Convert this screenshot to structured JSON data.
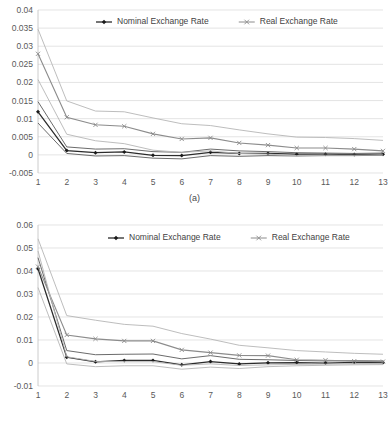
{
  "figure": {
    "panels": [
      {
        "id": "a",
        "caption": "(a)",
        "legend": [
          {
            "label": "Nominal Exchange Rate",
            "marker": "diamond-marker-icon",
            "color": "#2b2b2b"
          },
          {
            "label": "Real Exchange Rate",
            "marker": "x-marker-icon",
            "color": "#8c8c8c"
          }
        ]
      },
      {
        "id": "b",
        "caption": "(b)",
        "legend": [
          {
            "label": "Nominal Exchange Rate",
            "marker": "diamond-marker-icon",
            "color": "#2b2b2b"
          },
          {
            "label": "Real Exchange Rate",
            "marker": "x-marker-icon",
            "color": "#8c8c8c"
          }
        ]
      }
    ]
  },
  "chart_data": [
    {
      "type": "line",
      "title": "",
      "subtitle": "(a)",
      "xlabel": "",
      "ylabel": "",
      "x": [
        1,
        2,
        3,
        4,
        5,
        6,
        7,
        8,
        9,
        10,
        11,
        12,
        13
      ],
      "xtick_labels": [
        "1",
        "2",
        "3",
        "4",
        "5",
        "6",
        "7",
        "8",
        "9",
        "10",
        "11",
        "12",
        "13"
      ],
      "ytick_labels": [
        "-0.005",
        "0",
        "0.005",
        "0.01",
        "0.015",
        "0.02",
        "0.025",
        "0.03",
        "0.035",
        "0.04"
      ],
      "yticks": [
        -0.005,
        0,
        0.005,
        0.01,
        0.015,
        0.02,
        0.025,
        0.03,
        0.035,
        0.04
      ],
      "ylim": [
        -0.005,
        0.04
      ],
      "xlim": [
        1,
        13
      ],
      "grid": true,
      "legend_position": "top-center",
      "series": [
        {
          "name": "Nominal Exchange Rate",
          "role": "point-estimate",
          "marker": "diamond",
          "color": "#2b2b2b",
          "values": [
            0.0119,
            0.0012,
            0.0006,
            0.0008,
            -0.0001,
            -0.0002,
            0.0007,
            0.0004,
            0.0004,
            0.0002,
            0.0002,
            0.0001,
            0.0002
          ]
        },
        {
          "name": "Nominal Exchange Rate upper band",
          "role": "upper-confidence-band",
          "marker": "none",
          "color": "#5a5a5a",
          "values": [
            0.0147,
            0.0022,
            0.0016,
            0.0017,
            0.0009,
            0.0007,
            0.0016,
            0.0011,
            0.0009,
            0.0006,
            0.0005,
            0.0004,
            0.0005
          ]
        },
        {
          "name": "Nominal Exchange Rate lower band",
          "role": "lower-confidence-band",
          "marker": "none",
          "color": "#5a5a5a",
          "values": [
            0.0088,
            0.0004,
            -0.0003,
            -0.0002,
            -0.0009,
            -0.0011,
            -0.0002,
            -0.0004,
            -0.0002,
            -0.0003,
            -0.0002,
            -0.0002,
            -0.0001
          ]
        },
        {
          "name": "Real Exchange Rate",
          "role": "point-estimate",
          "marker": "x",
          "color": "#8c8c8c",
          "values": [
            0.0279,
            0.0104,
            0.0083,
            0.0079,
            0.0058,
            0.0044,
            0.0047,
            0.0033,
            0.0027,
            0.0019,
            0.0019,
            0.0016,
            0.0011
          ]
        },
        {
          "name": "Real Exchange Rate upper band",
          "role": "upper-confidence-band",
          "marker": "none",
          "color": "#b5b5b5",
          "values": [
            0.0347,
            0.0149,
            0.0121,
            0.0119,
            0.0102,
            0.0086,
            0.0081,
            0.0069,
            0.0058,
            0.0049,
            0.0048,
            0.0045,
            0.004
          ]
        },
        {
          "name": "Real Exchange Rate lower band",
          "role": "lower-confidence-band",
          "marker": "none",
          "color": "#b5b5b5",
          "values": [
            0.0208,
            0.0057,
            0.0039,
            0.0031,
            0.0013,
            0.0007,
            0.0011,
            0.0004,
            0.0002,
            -0.0002,
            -0.0001,
            -0.0001,
            0.0
          ]
        }
      ]
    },
    {
      "type": "line",
      "title": "",
      "subtitle": "(b)",
      "xlabel": "",
      "ylabel": "",
      "x": [
        1,
        2,
        3,
        4,
        5,
        6,
        7,
        8,
        9,
        10,
        11,
        12,
        13
      ],
      "xtick_labels": [
        "1",
        "2",
        "3",
        "4",
        "5",
        "6",
        "7",
        "8",
        "9",
        "10",
        "11",
        "12",
        "13"
      ],
      "ytick_labels": [
        "-0.01",
        "0",
        "0.01",
        "0.02",
        "0.03",
        "0.04",
        "0.05",
        "0.06"
      ],
      "yticks": [
        -0.01,
        0,
        0.01,
        0.02,
        0.03,
        0.04,
        0.05,
        0.06
      ],
      "ylim": [
        -0.01,
        0.06
      ],
      "xlim": [
        1,
        13
      ],
      "grid": true,
      "legend_position": "top-center",
      "series": [
        {
          "name": "Nominal Exchange Rate",
          "role": "point-estimate",
          "marker": "diamond",
          "color": "#2b2b2b",
          "values": [
            0.041,
            0.0025,
            0.0005,
            0.0011,
            0.0011,
            -0.0008,
            0.0006,
            -0.0004,
            0.0001,
            0.0002,
            0.0,
            0.0003,
            0.0002
          ]
        },
        {
          "name": "Nominal Exchange Rate upper band",
          "role": "upper-confidence-band",
          "marker": "none",
          "color": "#5a5a5a",
          "values": [
            0.0458,
            0.0054,
            0.0036,
            0.0038,
            0.0039,
            0.0018,
            0.0032,
            0.0016,
            0.0014,
            0.0011,
            0.0009,
            0.001,
            0.0009
          ]
        },
        {
          "name": "Nominal Exchange Rate lower band",
          "role": "lower-confidence-band",
          "marker": "none",
          "color": "#b5b5b5",
          "values": [
            0.0328,
            -0.0004,
            -0.0016,
            -0.0012,
            -0.0012,
            -0.0027,
            -0.0018,
            -0.0024,
            -0.0016,
            -0.0012,
            -0.001,
            -0.0008,
            -0.0007
          ]
        },
        {
          "name": "Real Exchange Rate",
          "role": "point-estimate",
          "marker": "x",
          "color": "#8c8c8c",
          "values": [
            0.0419,
            0.0122,
            0.0105,
            0.0096,
            0.0096,
            0.0057,
            0.0045,
            0.0033,
            0.0032,
            0.0014,
            0.0012,
            0.0008,
            0.0006
          ]
        },
        {
          "name": "Real Exchange Rate upper band",
          "role": "upper-confidence-band",
          "marker": "none",
          "color": "#8c8c8c",
          "values": [
            0.054,
            0.0206,
            0.0186,
            0.0168,
            0.016,
            0.0128,
            0.0104,
            0.0077,
            0.0066,
            0.0054,
            0.0048,
            0.0042,
            0.0038
          ]
        },
        {
          "name": "Real Exchange Rate lower band",
          "role": "lower-confidence-band",
          "marker": "none",
          "color": "#b5b5b5",
          "values": [
            0.0487,
            0.0027,
            0.0007,
            0.0006,
            0.0006,
            -0.001,
            -0.0004,
            -0.0011,
            -0.0008,
            -0.0006,
            -0.0005,
            -0.0004,
            -0.0003
          ]
        }
      ]
    }
  ]
}
